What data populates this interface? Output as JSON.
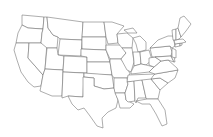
{
  "map": {
    "title": "United States state outline map",
    "background": "#ffffff",
    "stroke_color": "#6a6a6a",
    "fill_color": "#ffffff",
    "states": [
      {
        "id": "WA",
        "d": "M22,15 L44,17 L43,29 L28,28 L22,25 Z"
      },
      {
        "id": "OR",
        "d": "M22,25 L28,28 L43,29 L42,33 L41,43 L16,43 L18,33 Z"
      },
      {
        "id": "CA",
        "d": "M16,43 L29,43 L28,58 L43,75 L41,86 L34,87 L28,82 L21,72 L17,60 L14,50 Z"
      },
      {
        "id": "NV",
        "d": "M29,43 L47,43 L45,69 L43,75 L28,58 Z"
      },
      {
        "id": "ID",
        "d": "M44,17 L47,17 L48,28 L53,35 L58,37 L57,48 L47,48 L41,43 L42,33 L43,29 Z"
      },
      {
        "id": "MT",
        "d": "M47,17 L83,22 L82,40 L60,39 L58,37 L53,35 L48,28 Z"
      },
      {
        "id": "WY",
        "d": "M60,39 L82,40 L81,56 L58,55 Z"
      },
      {
        "id": "UT",
        "d": "M47,48 L57,48 L58,55 L64,56 L63,70 L45,69 Z"
      },
      {
        "id": "AZ",
        "d": "M45,69 L63,70 L62,96 L52,96 L40,91 L41,86 L43,75 Z"
      },
      {
        "id": "CO",
        "d": "M64,56 L87,57 L87,73 L63,72 Z"
      },
      {
        "id": "NM",
        "d": "M63,72 L84,73 L83,97 L68,96 L62,98 L62,96 Z"
      },
      {
        "id": "ND",
        "d": "M83,22 L104,22 L106,37 L82,37 Z"
      },
      {
        "id": "SD",
        "d": "M82,37 L106,37 L106,50 L82,49 Z"
      },
      {
        "id": "NE",
        "d": "M81,49 L106,50 L110,62 L87,62 L87,57 L81,56 Z"
      },
      {
        "id": "KS",
        "d": "M87,62 L110,62 L112,75 L87,74 Z"
      },
      {
        "id": "OK",
        "d": "M84,73 L112,75 L114,88 L104,89 L94,86 L94,78 L84,77 Z"
      },
      {
        "id": "TX",
        "d": "M83,77 L94,78 L94,86 L104,89 L114,88 L118,100 L116,108 L108,112 L102,118 L103,128 L97,126 L90,116 L84,108 L78,110 L72,104 L68,96 L83,97 Z"
      },
      {
        "id": "MN",
        "d": "M104,22 L112,22 L124,26 L117,34 L118,43 L108,44 L106,37 Z"
      },
      {
        "id": "IA",
        "d": "M106,45 L122,45 L126,53 L121,59 L110,59 L106,50 Z"
      },
      {
        "id": "MO",
        "d": "M110,59 L121,59 L127,67 L130,74 L127,78 L114,78 L112,75 L110,62 Z"
      },
      {
        "id": "AR",
        "d": "M114,78 L127,78 L128,84 L125,93 L115,93 L114,88 Z"
      },
      {
        "id": "LA",
        "d": "M115,93 L125,93 L126,100 L134,104 L130,108 L120,108 L118,100 Z"
      },
      {
        "id": "WI",
        "d": "M117,34 L127,33 L133,38 L132,48 L122,48 L118,43 Z"
      },
      {
        "id": "IL",
        "d": "M122,48 L132,48 L134,62 L131,72 L127,70 L121,59 L126,53 Z"
      },
      {
        "id": "MI",
        "d": "M133,38 L140,36 L146,42 L146,50 L138,52 L136,44 Z M124,30 L133,28 L137,33 L128,33 Z"
      },
      {
        "id": "IN",
        "d": "M133,52 L140,52 L141,64 L134,66 L134,62 Z"
      },
      {
        "id": "OH",
        "d": "M140,52 L149,50 L152,60 L146,65 L141,64 Z"
      },
      {
        "id": "KY",
        "d": "M131,72 L134,66 L141,64 L146,65 L154,67 L149,72 L131,74 Z"
      },
      {
        "id": "TN",
        "d": "M128,75 L155,74 L153,80 L127,82 Z"
      },
      {
        "id": "MS",
        "d": "M127,82 L134,81 L135,101 L128,102 L126,100 L125,93 L128,84 Z"
      },
      {
        "id": "AL",
        "d": "M134,81 L142,80 L146,98 L138,98 L136,103 L135,101 Z"
      },
      {
        "id": "GA",
        "d": "M142,80 L151,79 L160,90 L158,99 L147,99 L146,98 Z"
      },
      {
        "id": "FL",
        "d": "M136,101 L147,99 L158,99 L165,110 L167,124 L162,126 L156,114 L150,104 L142,104 Z"
      },
      {
        "id": "SC",
        "d": "M151,79 L160,78 L168,83 L160,90 Z"
      },
      {
        "id": "NC",
        "d": "M155,74 L178,70 L175,78 L168,83 L160,78 L151,79 L153,76 Z"
      },
      {
        "id": "VA",
        "d": "M149,72 L154,67 L161,61 L168,60 L177,68 L178,70 L155,74 Z"
      },
      {
        "id": "WV",
        "d": "M149,58 L155,57 L161,61 L154,67 L149,65 Z"
      },
      {
        "id": "PA",
        "d": "M150,48 L170,46 L172,52 L171,56 L152,57 Z"
      },
      {
        "id": "MD",
        "d": "M155,57 L171,56 L174,62 L168,60 L161,61 Z"
      },
      {
        "id": "DE",
        "d": "M171,56 L174,56 L175,62 L174,62 Z"
      },
      {
        "id": "NJ",
        "d": "M172,48 L176,50 L176,58 L172,57 L172,52 Z"
      },
      {
        "id": "NY",
        "d": "M150,48 L158,40 L168,36 L173,36 L175,46 L172,48 L170,46 Z"
      },
      {
        "id": "CT",
        "d": "M175,44 L180,43 L180,46 L175,47 Z"
      },
      {
        "id": "RI",
        "d": "M180,43 L182,43 L182,45 L180,46 Z"
      },
      {
        "id": "MA",
        "d": "M174,40 L183,39 L186,42 L182,43 L175,44 Z"
      },
      {
        "id": "VT",
        "d": "M172,30 L176,29 L176,40 L173,40 Z"
      },
      {
        "id": "NH",
        "d": "M176,29 L178,28 L181,37 L179,39 L176,40 Z"
      },
      {
        "id": "ME",
        "d": "M178,28 L180,18 L184,16 L191,24 L186,31 L181,37 Z"
      }
    ]
  }
}
